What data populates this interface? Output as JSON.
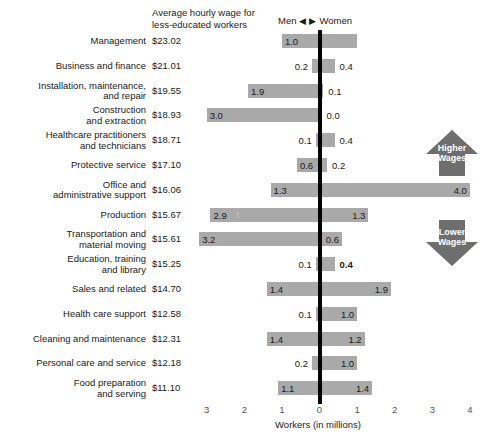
{
  "header": {
    "wage_column_title": "Average hourly wage for less-educated workers",
    "direction_label_men": "Men",
    "direction_label_women": "Women",
    "left_triangle": "◀",
    "right_triangle": "▶"
  },
  "axis": {
    "title": "Workers (in millions)",
    "ticks": [
      {
        "label": "3",
        "value": -3
      },
      {
        "label": "2",
        "value": -2
      },
      {
        "label": "1",
        "value": -1
      },
      {
        "label": "0",
        "value": 0
      },
      {
        "label": "1",
        "value": 1
      },
      {
        "label": "2",
        "value": 2
      },
      {
        "label": "3",
        "value": 3
      },
      {
        "label": "4",
        "value": 4
      }
    ]
  },
  "badges": {
    "higher": {
      "line1": "Higher",
      "line2": "Wages",
      "direction": "up"
    },
    "lower": {
      "line1": "Lower",
      "line2": "Wages",
      "direction": "down"
    }
  },
  "colors": {
    "bar": "#a9a9a9",
    "axis": "#000000",
    "badge": "#6e6e6e",
    "text": "#1a1a1a"
  },
  "chart_data": {
    "type": "bar",
    "orientation": "horizontal-diverging",
    "title": "Average hourly wage for less-educated workers",
    "xlabel": "Workers (in millions)",
    "ylabel": "",
    "xlim": [
      -3.5,
      4.5
    ],
    "grid": false,
    "legend_position": "top",
    "series": [
      {
        "name": "Men",
        "side": "left",
        "values": [
          1.0,
          0.2,
          1.9,
          3.0,
          0.1,
          0.6,
          1.3,
          2.9,
          3.2,
          0.1,
          1.4,
          0.1,
          1.4,
          0.2,
          1.1
        ]
      },
      {
        "name": "Women",
        "side": "right",
        "values": [
          1.0,
          0.4,
          0.1,
          0.0,
          0.4,
          0.2,
          4.0,
          1.3,
          0.6,
          0.4,
          1.9,
          1.0,
          1.2,
          1.0,
          1.4
        ]
      }
    ],
    "categories": [
      "Management",
      "Business and finance",
      "Installation, maintenance, and repair",
      "Construction and extraction",
      "Healthcare practitioners and technicians",
      "Protective service",
      "Office and administrative support",
      "Production",
      "Transportation and material moving",
      "Education, training and library",
      "Sales and related",
      "Health care support",
      "Cleaning and maintenance",
      "Personal care and service",
      "Food preparation and serving"
    ],
    "wages": [
      "$23.02",
      "$21.01",
      "$19.55",
      "$18.93",
      "$18.71",
      "$17.10",
      "$16.06",
      "$15.67",
      "$15.61",
      "$15.25",
      "$14.70",
      "$12.58",
      "$12.31",
      "$12.18",
      "$11.10"
    ]
  },
  "rows": [
    {
      "occupation_lines": [
        "Management"
      ],
      "wage": "$23.02",
      "men": 1.0,
      "women": 1.0,
      "men_label": "1.0",
      "women_label": "",
      "men_label_inside": true,
      "women_label_inside": false,
      "women_bold": false,
      "marker": ""
    },
    {
      "occupation_lines": [
        "Business and finance"
      ],
      "wage": "$21.01",
      "men": 0.2,
      "women": 0.4,
      "men_label": "0.2",
      "women_label": "0.4",
      "men_label_inside": false,
      "women_label_inside": false,
      "women_bold": false,
      "marker": ""
    },
    {
      "occupation_lines": [
        "Installation, maintenance,",
        "and repair"
      ],
      "wage": "$19.55",
      "men": 1.9,
      "women": 0.1,
      "men_label": "1.9",
      "women_label": "0.1",
      "men_label_inside": true,
      "women_label_inside": false,
      "women_bold": false,
      "marker": ""
    },
    {
      "occupation_lines": [
        "Construction",
        "and extraction"
      ],
      "wage": "$18.93",
      "men": 3.0,
      "women": 0.0,
      "men_label": "3.0",
      "women_label": "0.0",
      "men_label_inside": true,
      "women_label_inside": false,
      "women_bold": false,
      "marker": ""
    },
    {
      "occupation_lines": [
        "Healthcare practitioners",
        "and technicians"
      ],
      "wage": "$18.71",
      "men": 0.1,
      "women": 0.4,
      "men_label": "0.1",
      "women_label": "0.4",
      "men_label_inside": false,
      "women_label_inside": false,
      "women_bold": false,
      "marker": ""
    },
    {
      "occupation_lines": [
        "Protective service"
      ],
      "wage": "$17.10",
      "men": 0.6,
      "women": 0.2,
      "men_label": "0.6",
      "women_label": "0.2",
      "men_label_inside": true,
      "women_label_inside": false,
      "women_bold": false,
      "marker": ""
    },
    {
      "occupation_lines": [
        "Office and",
        "administrative support"
      ],
      "wage": "$16.06",
      "men": 1.3,
      "women": 4.0,
      "men_label": "1.3",
      "women_label": "4.0",
      "men_label_inside": true,
      "women_label_inside": true,
      "women_bold": false,
      "marker": ""
    },
    {
      "occupation_lines": [
        "Production"
      ],
      "wage": "$15.67",
      "men": 2.9,
      "women": 1.3,
      "men_label": "2.9",
      "women_label": "1.3",
      "men_label_inside": true,
      "women_label_inside": true,
      "women_bold": false,
      "marker": "!"
    },
    {
      "occupation_lines": [
        "Transportation and",
        "material moving"
      ],
      "wage": "$15.61",
      "men": 3.2,
      "women": 0.6,
      "men_label": "3.2",
      "women_label": "0.6",
      "men_label_inside": true,
      "women_label_inside": true,
      "women_bold": false,
      "marker": ""
    },
    {
      "occupation_lines": [
        "Education, training",
        "and library"
      ],
      "wage": "$15.25",
      "men": 0.1,
      "women": 0.4,
      "men_label": "0.1",
      "women_label": "0.4",
      "men_label_inside": false,
      "women_label_inside": false,
      "women_bold": true,
      "marker": ""
    },
    {
      "occupation_lines": [
        "Sales and related"
      ],
      "wage": "$14.70",
      "men": 1.4,
      "women": 1.9,
      "men_label": "1.4",
      "women_label": "1.9",
      "men_label_inside": true,
      "women_label_inside": true,
      "women_bold": false,
      "marker": ""
    },
    {
      "occupation_lines": [
        "Health care support"
      ],
      "wage": "$12.58",
      "men": 0.1,
      "women": 1.0,
      "men_label": "0.1",
      "women_label": "1.0",
      "men_label_inside": false,
      "women_label_inside": true,
      "women_bold": false,
      "marker": ""
    },
    {
      "occupation_lines": [
        "Cleaning and maintenance"
      ],
      "wage": "$12.31",
      "men": 1.4,
      "women": 1.2,
      "men_label": "1.4",
      "women_label": "1.2",
      "men_label_inside": true,
      "women_label_inside": true,
      "women_bold": false,
      "marker": ""
    },
    {
      "occupation_lines": [
        "Personal care and service"
      ],
      "wage": "$12.18",
      "men": 0.2,
      "women": 1.0,
      "men_label": "0.2",
      "women_label": "1.0",
      "men_label_inside": false,
      "women_label_inside": true,
      "women_bold": false,
      "marker": ""
    },
    {
      "occupation_lines": [
        "Food preparation",
        "and serving"
      ],
      "wage": "$11.10",
      "men": 1.1,
      "women": 1.4,
      "men_label": "1.1",
      "women_label": "1.4",
      "men_label_inside": true,
      "women_label_inside": true,
      "women_bold": false,
      "marker": ""
    }
  ]
}
